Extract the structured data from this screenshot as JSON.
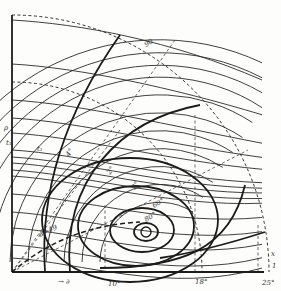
{
  "diagram": {
    "type": "polar-quadrant-contour-diagram",
    "style": {
      "ink": "#2a2a2a",
      "background": "#fdfdfb"
    },
    "origin": {
      "x": 12,
      "y": 272
    },
    "axes": {
      "vertical": {
        "x": 12,
        "y_top": 15,
        "y_bottom": 272,
        "label": "ρ",
        "label_pos": {
          "x": 4,
          "y": 130
        }
      },
      "horizontal": {
        "y": 272,
        "x_left": 12,
        "x_right": 264,
        "arrow_label": "→ ∂",
        "arrow_label_pos": {
          "x": 58,
          "y": 284
        }
      }
    },
    "dashed_arcs": [
      {
        "r": 257,
        "name": "outer-boundary-arc"
      },
      {
        "r": 190,
        "name": "inner-boundary-arc"
      }
    ],
    "center_point": {
      "x": 146,
      "y": 232,
      "r": 5
    },
    "labels": [
      {
        "text": "90",
        "x": 146,
        "y": 47,
        "rotate": -30
      },
      {
        "text": "t₁",
        "x": 37,
        "y": 151,
        "rotate": 0
      },
      {
        "text": "t₁",
        "x": 6,
        "y": 145,
        "rotate": 0
      },
      {
        "text": "4°",
        "x": 69,
        "y": 157,
        "rotate": -55
      },
      {
        "text": "2°",
        "x": 110,
        "y": 175,
        "rotate": -55
      },
      {
        "text": "3°",
        "x": 135,
        "y": 190,
        "rotate": -55
      },
      {
        "text": "60°",
        "x": 154,
        "y": 208,
        "rotate": -30
      },
      {
        "text": "80°",
        "x": 146,
        "y": 222,
        "rotate": -30
      },
      {
        "text": "α=49",
        "x": 40,
        "y": 237,
        "rotate": -25
      },
      {
        "text": "10°",
        "x": 108,
        "y": 286,
        "rotate": 0
      },
      {
        "text": "18°",
        "x": 195,
        "y": 284,
        "rotate": 0
      },
      {
        "text": "25°",
        "x": 262,
        "y": 285,
        "rotate": 0
      },
      {
        "text": "x",
        "x": 271,
        "y": 256,
        "rotate": 0
      },
      {
        "text": "1",
        "x": 272,
        "y": 268,
        "rotate": 0
      }
    ],
    "thick_ellipses": [
      {
        "cx": 146,
        "cy": 232,
        "rx": 12,
        "ry": 9
      },
      {
        "cx": 142,
        "cy": 230,
        "rx": 32,
        "ry": 22
      },
      {
        "cx": 136,
        "cy": 226,
        "rx": 58,
        "ry": 40
      },
      {
        "cx": 130,
        "cy": 220,
        "rx": 88,
        "ry": 62
      }
    ]
  }
}
